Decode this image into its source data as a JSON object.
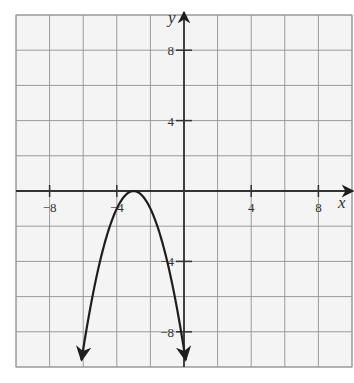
{
  "chart_data": {
    "type": "line",
    "title": "",
    "xlabel": "x",
    "ylabel": "y",
    "xlim": [
      -10,
      10
    ],
    "ylim": [
      -10,
      10
    ],
    "grid": true,
    "grid_step": 2,
    "x_ticks": [
      -8,
      -4,
      4,
      8
    ],
    "y_ticks": [
      8,
      4,
      -4,
      -8
    ],
    "x_tick_labels": [
      "−8",
      "−4",
      "4",
      "8"
    ],
    "y_tick_labels": [
      "8",
      "4",
      "−4",
      "−8"
    ],
    "series": [
      {
        "name": "parabola",
        "equation": "y = -(x + 3)^2",
        "vertex": [
          -3,
          0
        ],
        "opens": "down",
        "x": [
          -6.1,
          -5,
          -4,
          -3,
          -2,
          -1,
          0.1
        ],
        "values": [
          -9.6,
          -4,
          -1,
          0,
          -1,
          -4,
          -9.6
        ],
        "arrows_at_ends": true
      }
    ],
    "legend": null
  },
  "colors": {
    "background": "#f4f4f4",
    "grid": "#9a9a9a",
    "axis": "#333333",
    "curve": "#1e1e1e"
  }
}
